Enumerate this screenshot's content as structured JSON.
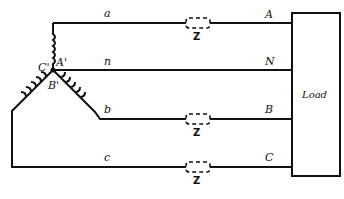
{
  "diagram": {
    "type": "three-phase wye source with neutral feeding load",
    "lines": {
      "a": "a",
      "n": "n",
      "b": "b",
      "c": "c"
    },
    "load_terminals": {
      "A": "A",
      "N": "N",
      "B": "B",
      "C": "C"
    },
    "source_nodes": {
      "A_prime": "A'",
      "B_prime": "B'",
      "C_prime": "C'"
    },
    "impedance_label": "Z",
    "load_label": "Load"
  }
}
